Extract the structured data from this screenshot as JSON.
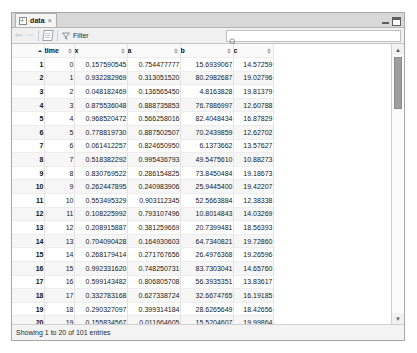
{
  "window": {
    "tab_label": "data",
    "tab_close": "×",
    "minimize_label": "minimize",
    "maximize_label": "maximize"
  },
  "toolbar": {
    "back_label": "⇦",
    "forward_label": "⇨",
    "export_label": "export-sheet",
    "filter_label": "Filter",
    "search_value": "",
    "search_placeholder": ""
  },
  "table": {
    "columns": [
      {
        "key": "rownum",
        "label": "",
        "sorted": true
      },
      {
        "key": "time",
        "label": "time",
        "sorted": false
      },
      {
        "key": "x",
        "label": "x",
        "sorted": false
      },
      {
        "key": "a",
        "label": "a",
        "sorted": false
      },
      {
        "key": "b",
        "label": "b",
        "sorted": false
      },
      {
        "key": "c",
        "label": "c",
        "sorted": false
      }
    ],
    "rows": [
      {
        "rownum": "1",
        "time": "0",
        "x": "0.157590545",
        "a": "0.754477777",
        "b": "15.6939067",
        "c": "14.57259"
      },
      {
        "rownum": "2",
        "time": "1",
        "x": "0.932282969",
        "a": "0.313051520",
        "b": "80.2982687",
        "c": "19.02796"
      },
      {
        "rownum": "3",
        "time": "2",
        "x": "0.048182469",
        "a": "0.136565450",
        "b": "4.8163828",
        "c": "19.81379"
      },
      {
        "rownum": "4",
        "time": "3",
        "x": "0.875536048",
        "a": "0.888735853",
        "b": "76.7886997",
        "c": "12.60788"
      },
      {
        "rownum": "5",
        "time": "4",
        "x": "0.968520472",
        "a": "0.566258016",
        "b": "82.4048434",
        "c": "16.87829"
      },
      {
        "rownum": "6",
        "time": "5",
        "x": "0.778819730",
        "a": "0.887502507",
        "b": "70.2439859",
        "c": "12.62702"
      },
      {
        "rownum": "7",
        "time": "6",
        "x": "0.061412257",
        "a": "0.824650950",
        "b": "6.1373662",
        "c": "13.57627"
      },
      {
        "rownum": "8",
        "time": "7",
        "x": "0.518382292",
        "a": "0.995436793",
        "b": "49.5475610",
        "c": "10.88273"
      },
      {
        "rownum": "9",
        "time": "8",
        "x": "0.830769522",
        "a": "0.286154825",
        "b": "73.8450484",
        "c": "19.18673"
      },
      {
        "rownum": "10",
        "time": "9",
        "x": "0.262447895",
        "a": "0.240983906",
        "b": "25.9445400",
        "c": "19.42207"
      },
      {
        "rownum": "11",
        "time": "10",
        "x": "0.553495329",
        "a": "0.903112345",
        "b": "52.5663884",
        "c": "12.38338"
      },
      {
        "rownum": "12",
        "time": "11",
        "x": "0.108225992",
        "a": "0.793107496",
        "b": "10.8014843",
        "c": "14.03269"
      },
      {
        "rownum": "13",
        "time": "12",
        "x": "0.208915887",
        "a": "0.381259669",
        "b": "20.7399481",
        "c": "18.56393"
      },
      {
        "rownum": "14",
        "time": "13",
        "x": "0.704090428",
        "a": "0.164930603",
        "b": "64.7340821",
        "c": "19.72860"
      },
      {
        "rownum": "15",
        "time": "14",
        "x": "0.268179414",
        "a": "0.271767656",
        "b": "26.4976368",
        "c": "19.26596"
      },
      {
        "rownum": "16",
        "time": "15",
        "x": "0.992331620",
        "a": "0.748250731",
        "b": "83.7303041",
        "c": "14.65760"
      },
      {
        "rownum": "17",
        "time": "16",
        "x": "0.599143482",
        "a": "0.806805708",
        "b": "56.3935351",
        "c": "13.83617"
      },
      {
        "rownum": "18",
        "time": "17",
        "x": "0.332783168",
        "a": "0.627338724",
        "b": "32.6674765",
        "c": "16.19185"
      },
      {
        "rownum": "19",
        "time": "18",
        "x": "0.290327097",
        "a": "0.399314184",
        "b": "28.6265649",
        "c": "18.42656"
      },
      {
        "rownum": "20",
        "time": "19",
        "x": "0.155834567",
        "a": "0.011664605",
        "b": "15.5204607",
        "c": "19.99864"
      }
    ]
  },
  "status": {
    "text": "Showing 1 to 20 of 101 entries"
  },
  "scrollbar": {
    "up_label": "▲",
    "down_label": "▼"
  },
  "colors": {
    "window_border": "#a8a8a8",
    "tabbar_bg": "#d8d8d8",
    "toolbar_bg": "#f0f0f0",
    "header_bg": "#fafafa",
    "row_alt_bg": "#f6f6f6",
    "scroll_thumb": "#9e9e9e",
    "arrow_blue": "#a9b7c4"
  }
}
